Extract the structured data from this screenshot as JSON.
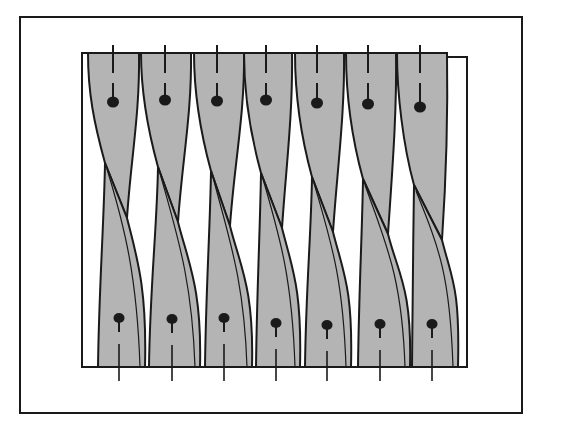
{
  "figure": {
    "type": "line-drawing",
    "colors": {
      "background": "#ffffff",
      "stroke": "#1a1a1a",
      "strip_fill": "#b4b4b4"
    },
    "outer_frame": {
      "x": 20,
      "y": 17,
      "width": 502,
      "height": 396
    },
    "inner_box": {
      "x": 82,
      "y": 53,
      "width": 385,
      "height": 314
    },
    "strip_count": 7,
    "strips": [
      {
        "top_left": 88,
        "top_right": 139,
        "cross_x": 127,
        "cross_y": 218,
        "bot_left": 98,
        "bot_right": 145,
        "top_dot": [
          113,
          102
        ],
        "bot_dot": [
          119,
          318
        ]
      },
      {
        "top_left": 141,
        "top_right": 191,
        "cross_x": 178,
        "cross_y": 222,
        "bot_left": 149,
        "bot_right": 200,
        "top_dot": [
          165,
          100
        ],
        "bot_dot": [
          172,
          319
        ]
      },
      {
        "top_left": 194,
        "top_right": 244,
        "cross_x": 230,
        "cross_y": 226,
        "bot_left": 205,
        "bot_right": 252,
        "top_dot": [
          217,
          101
        ],
        "bot_dot": [
          224,
          318
        ]
      },
      {
        "top_left": 244,
        "top_right": 292,
        "cross_x": 282,
        "cross_y": 228,
        "bot_left": 256,
        "bot_right": 300,
        "top_dot": [
          266,
          100
        ],
        "bot_dot": [
          276,
          323
        ]
      },
      {
        "top_left": 295,
        "top_right": 344,
        "cross_x": 333,
        "cross_y": 232,
        "bot_left": 305,
        "bot_right": 351,
        "top_dot": [
          317,
          103
        ],
        "bot_dot": [
          327,
          325
        ]
      },
      {
        "top_left": 346,
        "top_right": 396,
        "cross_x": 388,
        "cross_y": 234,
        "bot_left": 358,
        "bot_right": 410,
        "top_dot": [
          368,
          104
        ],
        "bot_dot": [
          380,
          324
        ]
      },
      {
        "top_left": 397,
        "top_right": 447,
        "cross_x": 442,
        "cross_y": 240,
        "bot_left": 412,
        "bot_right": 458,
        "top_dot": [
          420,
          107
        ],
        "bot_dot": [
          432,
          324
        ]
      }
    ]
  },
  "caption": {
    "text": ""
  }
}
